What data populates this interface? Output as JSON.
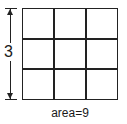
{
  "diagram": {
    "rows": 3,
    "cols": 3,
    "side_label": "3",
    "area_label": "area=9",
    "line_color": "#222222"
  }
}
